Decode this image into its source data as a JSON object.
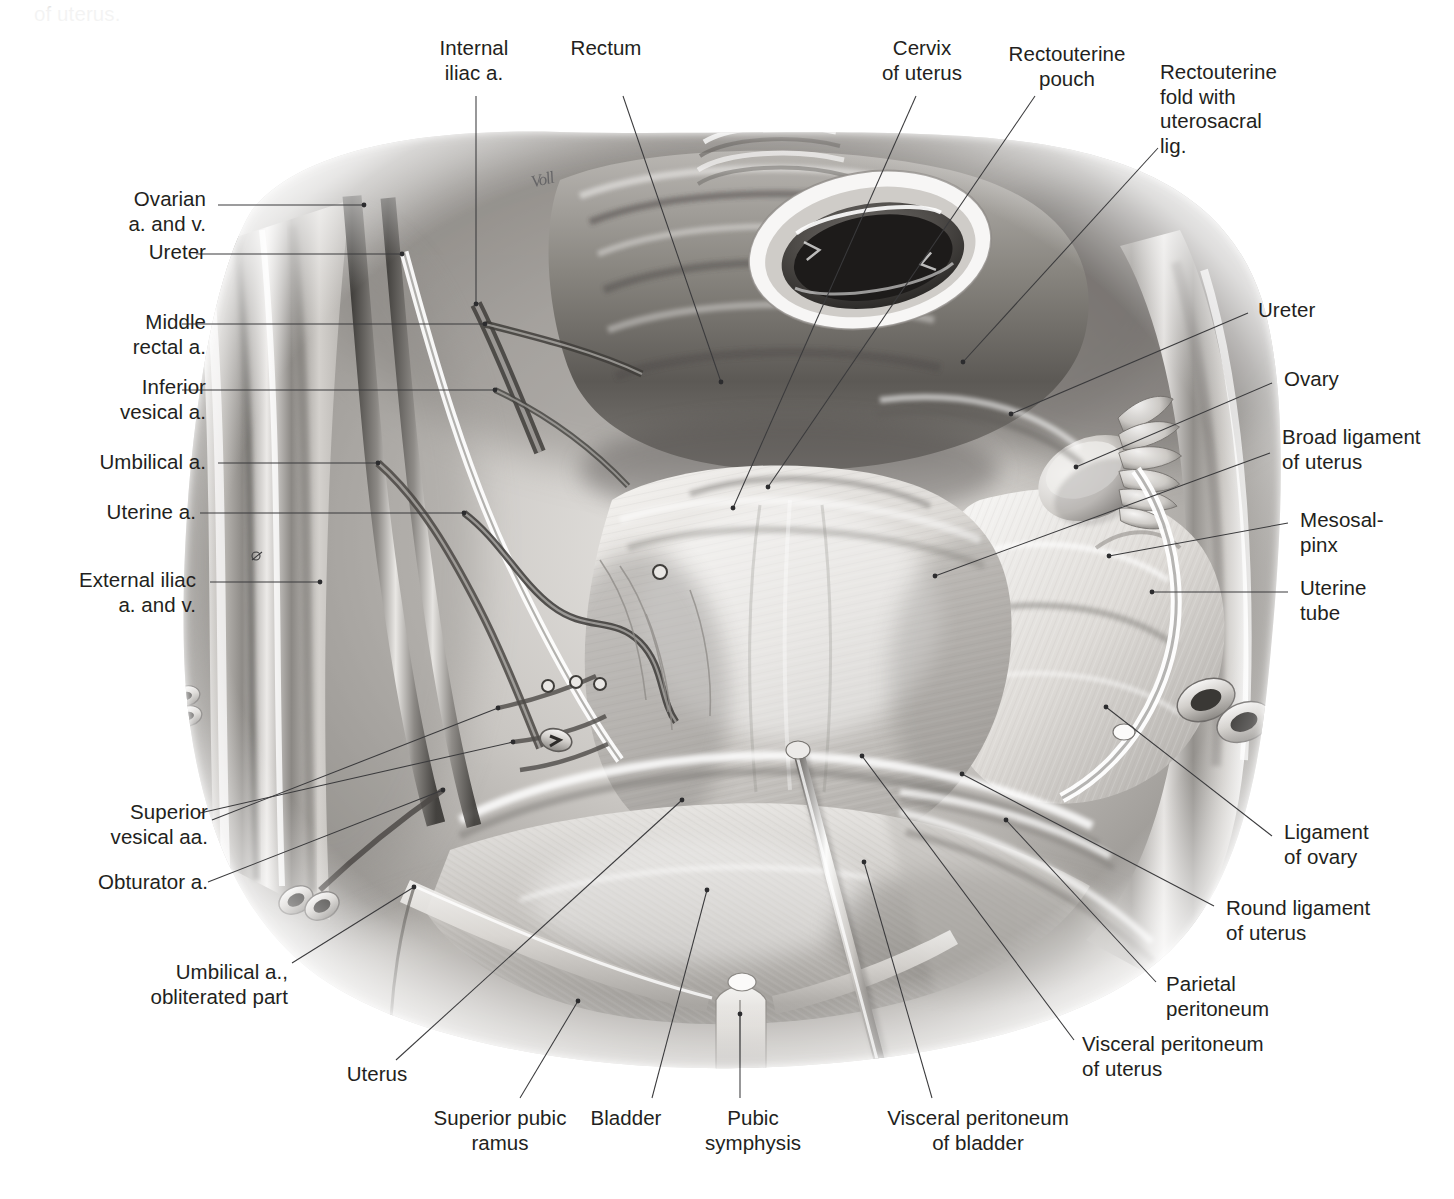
{
  "caption": {
    "line1_clipped": "pelvis, viewed from above; bladder. Peritoneum and broad ligament",
    "line2": "of uterus."
  },
  "illustration": {
    "title": "Female pelvis superior view — peritoneum and broad ligament of uterus",
    "style": "grayscale airbrush / pencil medical illustration",
    "signature": "Voll"
  },
  "labels": [
    {
      "id": "internal-iliac-a",
      "text": "Internal\niliac a.",
      "align": "c",
      "x": 404,
      "y": 36,
      "w": 140
    },
    {
      "id": "rectum",
      "text": "Rectum",
      "align": "c",
      "x": 536,
      "y": 36,
      "w": 140
    },
    {
      "id": "cervix-of-uterus",
      "text": "Cervix\nof uterus",
      "align": "c",
      "x": 852,
      "y": 36,
      "w": 140
    },
    {
      "id": "rectouterine-pouch",
      "text": "Rectouterine\npouch",
      "align": "c",
      "x": 992,
      "y": 42,
      "w": 150
    },
    {
      "id": "rectouterine-fold",
      "text": "Rectouterine\nfold with\nuterosacral\nlig.",
      "align": "l",
      "x": 1160,
      "y": 60,
      "w": 150
    },
    {
      "id": "ovarian-a-and-v",
      "text": "Ovarian\na. and v.",
      "align": "r",
      "x": 46,
      "y": 187,
      "w": 160
    },
    {
      "id": "ureter-left",
      "text": "Ureter",
      "align": "r",
      "x": 46,
      "y": 240,
      "w": 160
    },
    {
      "id": "middle-rectal-a",
      "text": "Middle\nrectal a.",
      "align": "r",
      "x": 46,
      "y": 310,
      "w": 160
    },
    {
      "id": "inferior-vesical-a",
      "text": "Inferior\nvesical a.",
      "align": "r",
      "x": 46,
      "y": 375,
      "w": 160
    },
    {
      "id": "umbilical-a",
      "text": "Umbilical a.",
      "align": "r",
      "x": 26,
      "y": 450,
      "w": 180
    },
    {
      "id": "uterine-a",
      "text": "Uterine a.",
      "align": "r",
      "x": 26,
      "y": 500,
      "w": 170
    },
    {
      "id": "external-iliac-a-and-v",
      "text": "External iliac\na. and v.",
      "align": "r",
      "x": 14,
      "y": 568,
      "w": 182
    },
    {
      "id": "superior-vesical-aa",
      "text": "Superior\nvesical aa.",
      "align": "r",
      "x": 24,
      "y": 800,
      "w": 184
    },
    {
      "id": "obturator-a",
      "text": "Obturator a.",
      "align": "r",
      "x": 24,
      "y": 870,
      "w": 184
    },
    {
      "id": "umbilical-a-obliterated",
      "text": "Umbilical a.,\nobliterated part",
      "align": "r",
      "x": 60,
      "y": 960,
      "w": 228
    },
    {
      "id": "ureter-right",
      "text": "Ureter",
      "align": "l",
      "x": 1258,
      "y": 298,
      "w": 190
    },
    {
      "id": "ovary",
      "text": "Ovary",
      "align": "l",
      "x": 1284,
      "y": 367,
      "w": 165
    },
    {
      "id": "broad-ligament-of-uterus",
      "text": "Broad ligament\nof uterus",
      "align": "l",
      "x": 1282,
      "y": 425,
      "w": 175
    },
    {
      "id": "mesosalpinx",
      "text": "Mesosal-\npinx",
      "align": "l",
      "x": 1300,
      "y": 508,
      "w": 150
    },
    {
      "id": "uterine-tube",
      "text": "Uterine\ntube",
      "align": "l",
      "x": 1300,
      "y": 576,
      "w": 150
    },
    {
      "id": "ligament-of-ovary",
      "text": "Ligament\nof ovary",
      "align": "l",
      "x": 1284,
      "y": 820,
      "w": 168
    },
    {
      "id": "round-ligament-of-uterus",
      "text": "Round ligament\nof uterus",
      "align": "l",
      "x": 1226,
      "y": 896,
      "w": 226
    },
    {
      "id": "parietal-peritoneum",
      "text": "Parietal\nperitoneum",
      "align": "l",
      "x": 1166,
      "y": 972,
      "w": 190
    },
    {
      "id": "visceral-peritoneum-uterus",
      "text": "Visceral peritoneum\nof uterus",
      "align": "l",
      "x": 1082,
      "y": 1032,
      "w": 250
    },
    {
      "id": "uterus",
      "text": "Uterus",
      "align": "c",
      "x": 312,
      "y": 1062,
      "w": 130
    },
    {
      "id": "superior-pubic-ramus",
      "text": "Superior pubic\nramus",
      "align": "c",
      "x": 410,
      "y": 1106,
      "w": 180
    },
    {
      "id": "bladder",
      "text": "Bladder",
      "align": "c",
      "x": 516,
      "y": 1106,
      "w": 220
    },
    {
      "id": "pubic-symphysis",
      "text": "Pubic\nsymphysis",
      "align": "c",
      "x": 672,
      "y": 1106,
      "w": 162
    },
    {
      "id": "visceral-peritoneum-bladder",
      "text": "Visceral peritoneum\nof bladder",
      "align": "c",
      "x": 852,
      "y": 1106,
      "w": 252
    }
  ],
  "leaders": [
    {
      "id": "internal-iliac-a",
      "d": "M 476,96 L 476,304",
      "dot": [
        476,
        304
      ]
    },
    {
      "id": "rectum",
      "d": "M 623,96 L 721,382",
      "dot": [
        721,
        382
      ]
    },
    {
      "id": "cervix-of-uterus",
      "d": "M 916,96 L 733,508",
      "dot": [
        733,
        508
      ]
    },
    {
      "id": "rectouterine-pouch",
      "d": "M 1035,96 L 768,487",
      "dot": [
        768,
        487
      ]
    },
    {
      "id": "rectouterine-fold",
      "d": "M 1158,148 L 963,362",
      "dot": [
        963,
        362
      ]
    },
    {
      "id": "ovarian-a-and-v",
      "d": "M 218,205 L 364,205",
      "dot": [
        364,
        205
      ]
    },
    {
      "id": "ureter-left",
      "d": "M 196,254 L 402,254",
      "dot": [
        402,
        254
      ]
    },
    {
      "id": "middle-rectal-a",
      "d": "M 182,324 L 485,324",
      "dot": [
        485,
        324
      ]
    },
    {
      "id": "inferior-vesical-a",
      "d": "M 182,390 L 495,390",
      "dot": [
        495,
        390
      ]
    },
    {
      "id": "umbilical-a",
      "d": "M 218,463 L 378,463",
      "dot": [
        378,
        463
      ]
    },
    {
      "id": "uterine-a",
      "d": "M 200,513 L 464,513",
      "dot": [
        464,
        513
      ]
    },
    {
      "id": "external-iliac-a-and-v",
      "d": "M 210,582 L 320,582",
      "dot": [
        320,
        582
      ]
    },
    {
      "id": "external-iliac-hole",
      "d": "M 252,560 L 262,552",
      "hole": [
        256,
        556,
        4
      ]
    },
    {
      "id": "superior-vesical-aa",
      "d": "M 200,813 L 513,742",
      "dot": [
        513,
        742
      ]
    },
    {
      "id": "superior-vesical-aa-2",
      "d": "M 212,820 L 498,708",
      "dot": [
        498,
        708
      ]
    },
    {
      "id": "obturator-a",
      "d": "M 208,882 L 443,790",
      "dot": [
        443,
        790
      ]
    },
    {
      "id": "umbilical-a-obliterated",
      "d": "M 292,963 L 414,887",
      "dot": [
        414,
        887
      ]
    },
    {
      "id": "ureter-right",
      "d": "M 1248,313 L 1011,414",
      "dot": [
        1011,
        414
      ]
    },
    {
      "id": "ovary",
      "d": "M 1272,383 L 1076,467",
      "dot": [
        1076,
        467
      ]
    },
    {
      "id": "broad-ligament-of-uterus",
      "d": "M 1270,453 L 935,576",
      "dot": [
        935,
        576
      ]
    },
    {
      "id": "mesosalpinx",
      "d": "M 1288,523 L 1109,556",
      "dot": [
        1109,
        556
      ]
    },
    {
      "id": "uterine-tube",
      "d": "M 1288,592 L 1152,592",
      "dot": [
        1152,
        592
      ]
    },
    {
      "id": "ligament-of-ovary",
      "d": "M 1272,836 L 1106,707",
      "dot": [
        1106,
        707
      ]
    },
    {
      "id": "round-ligament-of-uterus",
      "d": "M 1214,906 L 962,774",
      "dot": [
        962,
        774
      ]
    },
    {
      "id": "parietal-peritoneum",
      "d": "M 1156,982 L 1006,820",
      "dot": [
        1006,
        820
      ]
    },
    {
      "id": "visceral-peritoneum-uterus",
      "d": "M 1074,1040 L 862,756",
      "dot": [
        862,
        756
      ]
    },
    {
      "id": "uterus",
      "d": "M 396,1060 L 682,800",
      "dot": [
        682,
        800
      ]
    },
    {
      "id": "superior-pubic-ramus",
      "d": "M 520,1098 L 578,1001",
      "dot": [
        578,
        1001
      ]
    },
    {
      "id": "bladder",
      "d": "M 652,1098 L 707,890",
      "dot": [
        707,
        890
      ]
    },
    {
      "id": "pubic-symphysis",
      "d": "M 740,1098 L 740,1014",
      "dot": [
        740,
        1014
      ]
    },
    {
      "id": "visceral-peritoneum-bladder",
      "d": "M 932,1098 L 864,862",
      "dot": [
        864,
        862
      ]
    }
  ],
  "colors": {
    "background": "#ffffff",
    "text": "#231f20",
    "leader": "#3a3a3c",
    "illustration_light": "#f2f1ef",
    "illustration_mid": "#a9a7a4",
    "illustration_dark": "#4a4845"
  }
}
